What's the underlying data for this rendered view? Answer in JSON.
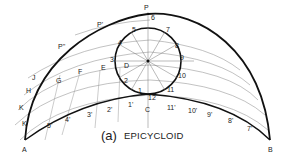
{
  "caption": {
    "prefix": "(a)",
    "title": "EPICYCLOID"
  },
  "labels": {
    "P": "P",
    "C": "C",
    "A": "A",
    "B": "B",
    "P1": "P'",
    "P2": "P''",
    "circle_points": [
      "1",
      "2",
      "3",
      "4",
      "5",
      "6",
      "7",
      "8",
      "9",
      "10",
      "11",
      "12"
    ],
    "base_points_left": [
      "1'",
      "2'",
      "3'",
      "4'",
      "5'"
    ],
    "base_points_right": [
      "11'",
      "10'",
      "9'",
      "8'",
      "7'"
    ],
    "center_arcs": [
      "D",
      "E",
      "F",
      "G"
    ],
    "left_arcs": [
      "H",
      "J",
      "K",
      "K"
    ]
  },
  "colors": {
    "curve": "#111111",
    "construction": "#888888",
    "text": "#222222"
  }
}
